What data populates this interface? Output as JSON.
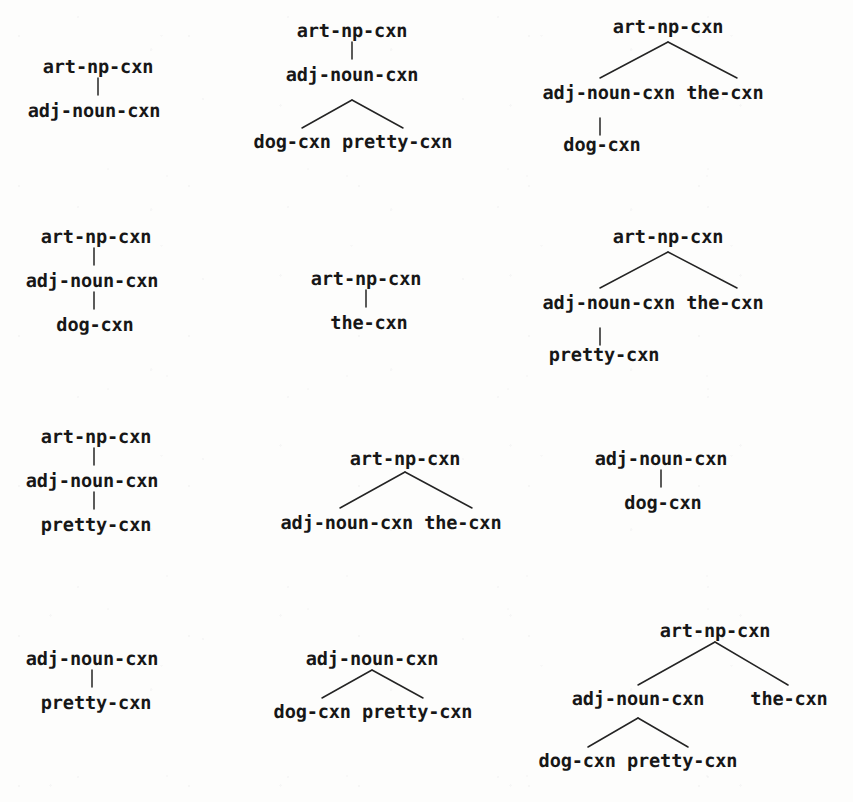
{
  "page": {
    "background_color": "#fdfdfc",
    "ink_color": "#171717",
    "tree_count": 12
  },
  "labels": {
    "art_np": "art-np-cxn",
    "adj_noun": "adj-noun-cxn",
    "dog": "dog-cxn",
    "pretty": "pretty-cxn",
    "the": "the-cxn",
    "dog_pretty": "dog-cxn pretty-cxn",
    "adjnoun_the": "adj-noun-cxn the-cxn"
  },
  "trees": [
    {
      "id": "tree-1",
      "nodes": [
        {
          "id": "n1",
          "text": "art-np-cxn"
        },
        {
          "id": "n2",
          "text": "adj-noun-cxn"
        }
      ],
      "edges": [
        "n1-n2"
      ]
    },
    {
      "id": "tree-2",
      "nodes": [
        {
          "id": "n1",
          "text": "art-np-cxn"
        },
        {
          "id": "n2",
          "text": "adj-noun-cxn"
        },
        {
          "id": "n3",
          "text": "dog-cxn pretty-cxn"
        }
      ],
      "edges": [
        "n1-n2",
        "n2-dog",
        "n2-pretty"
      ]
    },
    {
      "id": "tree-3",
      "nodes": [
        {
          "id": "n1",
          "text": "art-np-cxn"
        },
        {
          "id": "n2",
          "text": "adj-noun-cxn the-cxn"
        },
        {
          "id": "n3",
          "text": "dog-cxn"
        }
      ],
      "edges": [
        "n1-adjnoun",
        "n1-the",
        "adjnoun-dog"
      ]
    },
    {
      "id": "tree-4",
      "nodes": [
        {
          "id": "n1",
          "text": "art-np-cxn"
        },
        {
          "id": "n2",
          "text": "adj-noun-cxn"
        },
        {
          "id": "n3",
          "text": "dog-cxn"
        }
      ],
      "edges": [
        "n1-n2",
        "n2-n3"
      ]
    },
    {
      "id": "tree-5",
      "nodes": [
        {
          "id": "n1",
          "text": "art-np-cxn"
        },
        {
          "id": "n2",
          "text": "the-cxn"
        }
      ],
      "edges": [
        "n1-n2"
      ]
    },
    {
      "id": "tree-6",
      "nodes": [
        {
          "id": "n1",
          "text": "art-np-cxn"
        },
        {
          "id": "n2",
          "text": "adj-noun-cxn the-cxn"
        },
        {
          "id": "n3",
          "text": "pretty-cxn"
        }
      ],
      "edges": [
        "n1-adjnoun",
        "n1-the",
        "adjnoun-pretty"
      ]
    },
    {
      "id": "tree-7",
      "nodes": [
        {
          "id": "n1",
          "text": "art-np-cxn"
        },
        {
          "id": "n2",
          "text": "adj-noun-cxn"
        },
        {
          "id": "n3",
          "text": "pretty-cxn"
        }
      ],
      "edges": [
        "n1-n2",
        "n2-n3"
      ]
    },
    {
      "id": "tree-8",
      "nodes": [
        {
          "id": "n1",
          "text": "art-np-cxn"
        },
        {
          "id": "n2",
          "text": "adj-noun-cxn the-cxn"
        }
      ],
      "edges": [
        "n1-adjnoun",
        "n1-the"
      ]
    },
    {
      "id": "tree-9",
      "nodes": [
        {
          "id": "n1",
          "text": "adj-noun-cxn"
        },
        {
          "id": "n2",
          "text": "dog-cxn"
        }
      ],
      "edges": [
        "n1-n2"
      ]
    },
    {
      "id": "tree-10",
      "nodes": [
        {
          "id": "n1",
          "text": "adj-noun-cxn"
        },
        {
          "id": "n2",
          "text": "pretty-cxn"
        }
      ],
      "edges": [
        "n1-n2"
      ]
    },
    {
      "id": "tree-11",
      "nodes": [
        {
          "id": "n1",
          "text": "adj-noun-cxn"
        },
        {
          "id": "n2",
          "text": "dog-cxn pretty-cxn"
        }
      ],
      "edges": [
        "n1-dog",
        "n1-pretty"
      ]
    },
    {
      "id": "tree-12",
      "nodes": [
        {
          "id": "n1",
          "text": "art-np-cxn"
        },
        {
          "id": "n2",
          "text": "adj-noun-cxn"
        },
        {
          "id": "n3",
          "text": "the-cxn"
        },
        {
          "id": "n4",
          "text": "dog-cxn pretty-cxn"
        }
      ],
      "edges": [
        "n1-n2",
        "n1-n3",
        "n2-dog",
        "n2-pretty"
      ]
    }
  ]
}
